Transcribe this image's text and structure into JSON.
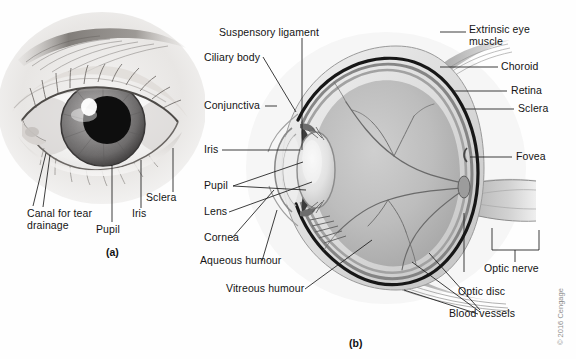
{
  "figure": {
    "title_a": "(a)",
    "title_b": "(b)",
    "copyright": "© 2016 Cengage"
  },
  "panel_a": {
    "name": "external-eye-photograph",
    "labels": [
      {
        "id": "canal-for-tear-drainage",
        "line1": "Canal for tear",
        "line2": "drainage"
      },
      {
        "id": "pupil",
        "text": "Pupil"
      },
      {
        "id": "iris",
        "text": "Iris"
      },
      {
        "id": "sclera",
        "text": "Sclera"
      }
    ]
  },
  "panel_b": {
    "name": "eye-cross-section-diagram",
    "labels_left": [
      {
        "id": "suspensory-ligament",
        "text": "Suspensory ligament"
      },
      {
        "id": "ciliary-body",
        "text": "Ciliary body"
      },
      {
        "id": "conjunctiva",
        "text": "Conjunctiva"
      },
      {
        "id": "iris",
        "text": "Iris"
      },
      {
        "id": "pupil",
        "text": "Pupil"
      },
      {
        "id": "lens",
        "text": "Lens"
      },
      {
        "id": "cornea",
        "text": "Cornea"
      },
      {
        "id": "aqueous-humour",
        "text": "Aqueous humour"
      },
      {
        "id": "vitreous-humour",
        "text": "Vitreous humour"
      }
    ],
    "labels_right": [
      {
        "id": "extrinsic-eye-muscle",
        "line1": "Extrinsic eye",
        "line2": "muscle"
      },
      {
        "id": "choroid",
        "text": "Choroid"
      },
      {
        "id": "retina",
        "text": "Retina"
      },
      {
        "id": "sclera",
        "text": "Sclera"
      },
      {
        "id": "fovea",
        "text": "Fovea"
      },
      {
        "id": "optic-nerve",
        "text": "Optic nerve"
      },
      {
        "id": "optic-disc",
        "text": "Optic disc"
      },
      {
        "id": "blood-vessels",
        "text": "Blood vessels"
      }
    ]
  },
  "colors": {
    "background": "#fefefe",
    "text": "#141414",
    "leader_line": "#1b1b1b",
    "sclera_outline": "#171717",
    "vitreous_fill": "#b9b9b9",
    "copyright_text": "#8e8e8e"
  }
}
